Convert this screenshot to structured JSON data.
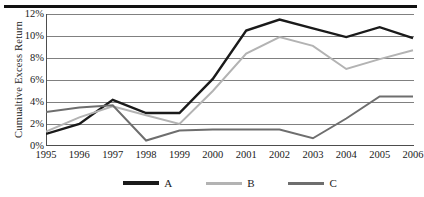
{
  "chart_data": {
    "type": "line",
    "title": "",
    "xlabel": "",
    "ylabel": "Cumualtive Excess Return",
    "categories": [
      "1995",
      "1996",
      "1997",
      "1998",
      "1999",
      "2000",
      "2001",
      "2002",
      "2003",
      "2004",
      "2005",
      "2006"
    ],
    "x": [
      1995,
      1996,
      1997,
      1998,
      1999,
      2000,
      2001,
      2002,
      2003,
      2004,
      2005,
      2006
    ],
    "series": [
      {
        "name": "A",
        "color": "#1a1a1a",
        "values": [
          1.1,
          2.0,
          4.2,
          3.0,
          3.0,
          6.1,
          10.5,
          11.5,
          10.7,
          9.9,
          10.8,
          9.8
        ]
      },
      {
        "name": "B",
        "color": "#b3b3b3",
        "values": [
          1.3,
          2.6,
          3.6,
          2.8,
          2.0,
          5.0,
          8.4,
          9.9,
          9.1,
          7.0,
          7.9,
          8.7
        ]
      },
      {
        "name": "C",
        "color": "#6e6e6e",
        "values": [
          3.1,
          3.5,
          3.7,
          0.5,
          1.4,
          1.5,
          1.5,
          1.5,
          0.7,
          2.5,
          4.5,
          4.5
        ]
      }
    ],
    "ylim": [
      0,
      12
    ],
    "yticks": [
      0,
      2,
      4,
      6,
      8,
      10,
      12
    ],
    "ytick_labels": [
      "0%",
      "2%",
      "4%",
      "6%",
      "8%",
      "10%",
      "12%"
    ],
    "grid": true,
    "grid_axis": "y",
    "legend_position": "bottom",
    "legend_entries": [
      "A",
      "B",
      "C"
    ]
  },
  "style": {
    "background": "#ffffff",
    "axis_color": "#4d4d4d",
    "grid_color": "#808080",
    "top_rule_color": "#111111"
  }
}
